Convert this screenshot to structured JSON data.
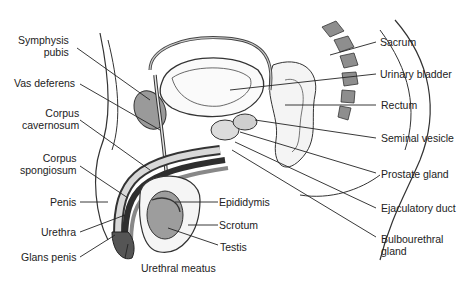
{
  "diagram": {
    "labels_left": [
      {
        "id": "symphysis-pubis",
        "lines": [
          "Symphysis",
          "pubis"
        ]
      },
      {
        "id": "vas-deferens",
        "lines": [
          "Vas deferens"
        ]
      },
      {
        "id": "corpus-cavernosum",
        "lines": [
          "Corpus",
          "cavernosum"
        ]
      },
      {
        "id": "corpus-spongiosum",
        "lines": [
          "Corpus",
          "spongiosum"
        ]
      },
      {
        "id": "penis",
        "lines": [
          "Penis"
        ]
      },
      {
        "id": "urethra",
        "lines": [
          "Urethra"
        ]
      },
      {
        "id": "glans-penis",
        "lines": [
          "Glans penis"
        ]
      }
    ],
    "labels_bottom": [
      {
        "id": "urethral-meatus",
        "lines": [
          "Urethral meatus"
        ]
      },
      {
        "id": "epididymis",
        "lines": [
          "Epididymis"
        ]
      },
      {
        "id": "scrotum",
        "lines": [
          "Scrotum"
        ]
      },
      {
        "id": "testis",
        "lines": [
          "Testis"
        ]
      }
    ],
    "labels_right": [
      {
        "id": "sacrum",
        "lines": [
          "Sacrum"
        ]
      },
      {
        "id": "urinary-bladder",
        "lines": [
          "Urinary bladder"
        ]
      },
      {
        "id": "rectum",
        "lines": [
          "Rectum"
        ]
      },
      {
        "id": "seminal-vesicle",
        "lines": [
          "Seminal vesicle"
        ]
      },
      {
        "id": "prostate-gland",
        "lines": [
          "Prostate gland"
        ]
      },
      {
        "id": "ejaculatory-duct",
        "lines": [
          "Ejaculatory duct"
        ]
      },
      {
        "id": "bulbourethral-gland",
        "lines": [
          "Bulbourethral",
          "gland"
        ]
      }
    ],
    "colors": {
      "line": "#333333",
      "shade": "#9a9a9a",
      "light_shade": "#d4d4d4",
      "dark": "#3a3a3a"
    }
  }
}
